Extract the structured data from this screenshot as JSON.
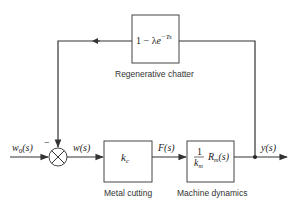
{
  "diagram": {
    "type": "block-diagram",
    "blocks": {
      "regenerative_chatter": {
        "transfer_function": "1 − λe^(−Ts)",
        "tf_main": "1 − λ",
        "tf_base": "e",
        "tf_exp": "−Ts",
        "label": "Regenerative chatter"
      },
      "metal_cutting": {
        "transfer_function": "k_c",
        "tf_main": "k",
        "tf_sub": "c",
        "label": "Metal cutting"
      },
      "machine_dynamics": {
        "transfer_function": "(1/k_m) R_m(s)",
        "frac_num": "1",
        "frac_den": "k",
        "frac_den_sub": "m",
        "tf_R": "R",
        "tf_R_sub": "m",
        "tf_R_arg": "(s)",
        "label": "Machine dynamics"
      }
    },
    "summing_junction": {
      "feedback_sign": "−"
    },
    "signals": {
      "input": "w0(s)",
      "input_main": "w",
      "input_sub": "0",
      "input_arg": "(s)",
      "error": "w(s)",
      "force": "F(s)",
      "output": "y(s)"
    }
  }
}
